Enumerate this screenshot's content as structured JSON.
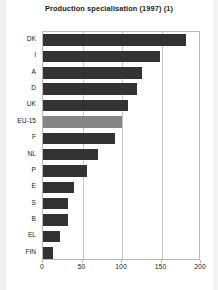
{
  "chart_data": {
    "type": "bar",
    "orientation": "horizontal",
    "title": "Production specialisation (1997) (1)",
    "xlabel": "",
    "ylabel": "",
    "categories": [
      "DK",
      "I",
      "A",
      "D",
      "UK",
      "EU-15",
      "F",
      "NL",
      "P",
      "E",
      "S",
      "B",
      "EL",
      "FIN"
    ],
    "values": [
      181,
      148,
      125,
      119,
      108,
      100,
      91,
      69,
      56,
      39,
      32,
      32,
      21,
      13
    ],
    "xlim": [
      0,
      200
    ],
    "xticks": [
      0,
      50,
      100,
      150,
      200
    ],
    "xtick_labels": [
      "0",
      "50",
      "100",
      "150",
      "200"
    ],
    "grid": true,
    "grid_axis": "x",
    "legend": null,
    "highlight_category": "EU-15",
    "colors": {
      "bar": "#333333",
      "bar_highlight": "#858585",
      "frame": "#b9b9b9",
      "gridline": "#c9c9c9",
      "text": "#1d1d1d",
      "background": "#ffffff"
    }
  }
}
